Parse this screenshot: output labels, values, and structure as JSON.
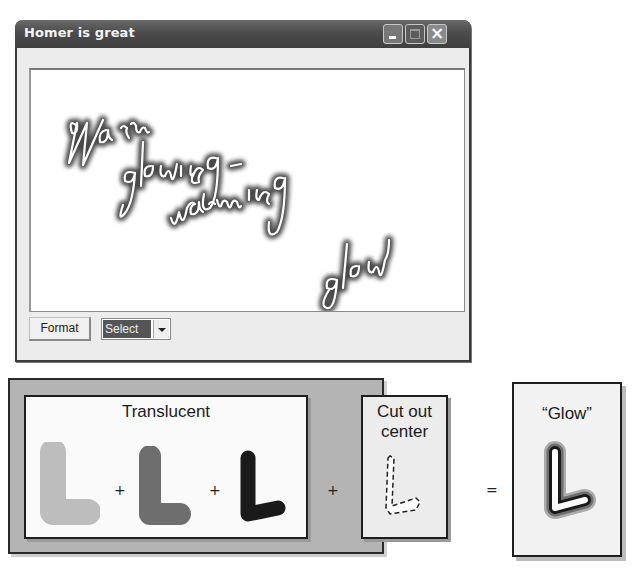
{
  "window": {
    "title": "Homer is great",
    "controls": {
      "minimize": "minimize-icon",
      "maximize": "maximize-icon",
      "close": "close-icon"
    },
    "canvas": {
      "handwriting_lines": [
        "Warm",
        "glowing -",
        "warming",
        "glow"
      ],
      "effect": "glow"
    },
    "toolbar": {
      "format_label": "Format",
      "select_value": "Select"
    }
  },
  "diagram": {
    "translucent_label": "Translucent",
    "translucent_layers": [
      {
        "name": "light-L",
        "color": "#bdbdbd"
      },
      {
        "name": "medium-L",
        "color": "#6e6e6e"
      },
      {
        "name": "dark-L",
        "color": "#1a1a1a"
      }
    ],
    "plus": "+",
    "cut_out_label_line1": "Cut out",
    "cut_out_label_line2": "center",
    "equals": "=",
    "result_label": "“Glow”"
  },
  "colors": {
    "titlebar": "#4b4b4b",
    "panel_outer": "#b4b4b4",
    "select_highlight": "#555555"
  }
}
